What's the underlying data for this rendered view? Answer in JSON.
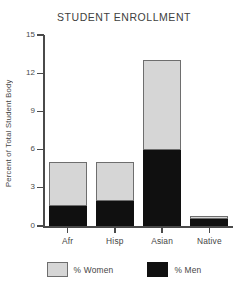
{
  "chart_data": {
    "type": "bar",
    "subtype": "stacked-bar",
    "title": "STUDENT ENROLLMENT",
    "xlabel": "",
    "ylabel": "Percent of Total Student Body",
    "categories": [
      "Afr",
      "Hisp",
      "Asian",
      "Native"
    ],
    "series": [
      {
        "name": "% Men",
        "color": "#101010",
        "values": [
          1.6,
          2.0,
          6.0,
          0.55
        ]
      },
      {
        "name": "% Women",
        "color": "#d6d6d6",
        "values": [
          3.4,
          3.0,
          7.0,
          0.25
        ]
      }
    ],
    "totals": [
      5.0,
      5.0,
      13.0,
      0.8
    ],
    "ylim": [
      0,
      15
    ],
    "yticks": [
      0,
      3,
      6,
      9,
      12,
      15
    ],
    "ytick_labels": [
      "0",
      "3",
      "6",
      "9",
      "12",
      "15"
    ],
    "grid": false,
    "legend_position": "bottom",
    "legend": [
      {
        "label": "% Women",
        "color": "#d6d6d6"
      },
      {
        "label": "% Men",
        "color": "#101010"
      }
    ]
  }
}
